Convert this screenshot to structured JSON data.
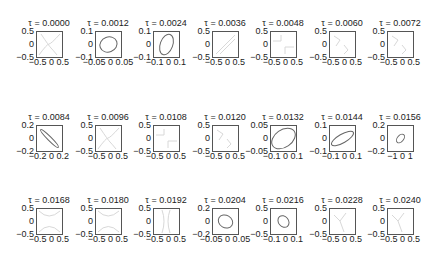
{
  "figure": {
    "background": "#ffffff",
    "axes_color": "#555555",
    "curve_color": "#666666",
    "faint_color": "#d8d8d8"
  },
  "chart_data": {
    "type": "line",
    "title": "",
    "layout": {
      "rows": 3,
      "cols": 7,
      "grid": false,
      "legend": "none"
    },
    "subplots": [
      {
        "title": "τ = 0.0000",
        "ylabels": [
          "0.5",
          "0",
          "−0.5"
        ],
        "xlabels": "−0.5 0 0.5",
        "xlim": [
          -0.5,
          0.5
        ],
        "ylim": [
          -0.5,
          0.5
        ],
        "curve": "faint-cross",
        "ellipse": null
      },
      {
        "title": "τ = 0.0012",
        "ylabels": [
          "0.1",
          "0",
          "−0.1"
        ],
        "xlabels": "−0.05 0 0.05",
        "xlim": [
          -0.05,
          0.05
        ],
        "ylim": [
          -0.1,
          0.1
        ],
        "curve": "ellipse",
        "ellipse": {
          "cx": 0,
          "cy": 0,
          "rx": 0.035,
          "ry": 0.06,
          "angle": -20
        }
      },
      {
        "title": "τ = 0.0024",
        "ylabels": [
          "0.1",
          "0",
          "−0.1"
        ],
        "xlabels": "−0.1 0 0.1",
        "xlim": [
          -0.1,
          0.1
        ],
        "ylim": [
          -0.1,
          0.1
        ],
        "curve": "ellipse",
        "ellipse": {
          "cx": 0,
          "cy": 0,
          "rx": 0.05,
          "ry": 0.085,
          "angle": 20
        }
      },
      {
        "title": "τ = 0.0036",
        "ylabels": [
          "0.5",
          "0",
          "−0.5"
        ],
        "xlabels": "−0.5 0 0.5",
        "xlim": [
          -0.5,
          0.5
        ],
        "ylim": [
          -0.5,
          0.5
        ],
        "curve": "faint-diagonal",
        "ellipse": null
      },
      {
        "title": "τ = 0.0048",
        "ylabels": [
          "0.5",
          "0",
          "−0.5"
        ],
        "xlabels": "−0.5 0 0.5",
        "xlim": [
          -0.5,
          0.5
        ],
        "ylim": [
          -0.5,
          0.5
        ],
        "curve": "faint-steps",
        "ellipse": null
      },
      {
        "title": "τ = 0.0060",
        "ylabels": [
          "0.5",
          "0",
          "−0.5"
        ],
        "xlabels": "−0.5 0 0.5",
        "xlim": [
          -0.5,
          0.5
        ],
        "ylim": [
          -0.5,
          0.5
        ],
        "curve": "faint-z",
        "ellipse": null
      },
      {
        "title": "τ = 0.0072",
        "ylabels": [
          "0.5",
          "0",
          "−0.5"
        ],
        "xlabels": "−0.5 0 0.5",
        "xlim": [
          -0.5,
          0.5
        ],
        "ylim": [
          -0.5,
          0.5
        ],
        "curve": "faint-z",
        "ellipse": null
      },
      {
        "title": "τ = 0.0084",
        "ylabels": [
          "0.2",
          "0",
          "−0.2"
        ],
        "xlabels": "−0.2 0 0.2",
        "xlim": [
          -0.2,
          0.2
        ],
        "ylim": [
          -0.2,
          0.2
        ],
        "curve": "ellipse",
        "ellipse": {
          "cx": 0,
          "cy": 0,
          "rx": 0.2,
          "ry": 0.03,
          "angle": 45
        }
      },
      {
        "title": "τ = 0.0096",
        "ylabels": [
          "0.5",
          "0",
          "−0.5"
        ],
        "xlabels": "−0.5 0 0.5",
        "xlim": [
          -0.5,
          0.5
        ],
        "ylim": [
          -0.5,
          0.5
        ],
        "curve": "faint-cross",
        "ellipse": null
      },
      {
        "title": "τ = 0.0108",
        "ylabels": [
          "0.5",
          "0",
          "−0.5"
        ],
        "xlabels": "−0.5 0 0.5",
        "xlim": [
          -0.5,
          0.5
        ],
        "ylim": [
          -0.5,
          0.5
        ],
        "curve": "faint-steps",
        "ellipse": null
      },
      {
        "title": "τ = 0.0120",
        "ylabels": [
          "0.5",
          "0",
          "−0.5"
        ],
        "xlabels": "−0.5 0 0.5",
        "xlim": [
          -0.5,
          0.5
        ],
        "ylim": [
          -0.5,
          0.5
        ],
        "curve": "faint-z",
        "ellipse": null
      },
      {
        "title": "τ = 0.0132",
        "ylabels": [
          "0.05",
          "0",
          "−0.05"
        ],
        "xlabels": "−0.1 0 0.1",
        "xlim": [
          -0.1,
          0.1
        ],
        "ylim": [
          -0.05,
          0.05
        ],
        "curve": "ellipse",
        "ellipse": {
          "cx": 0,
          "cy": 0,
          "rx": 0.11,
          "ry": 0.035,
          "angle": -35
        }
      },
      {
        "title": "τ = 0.0144",
        "ylabels": [
          "0.1",
          "0",
          "−0.1"
        ],
        "xlabels": "−0.1 0 0.1",
        "xlim": [
          -0.1,
          0.1
        ],
        "ylim": [
          -0.1,
          0.1
        ],
        "curve": "ellipse",
        "ellipse": {
          "cx": 0,
          "cy": 0,
          "rx": 0.1,
          "ry": 0.035,
          "angle": -30
        }
      },
      {
        "title": "τ = 0.0156",
        "ylabels": [
          "0.2",
          "0",
          "−0.2"
        ],
        "xlabels": "−1 0 1",
        "xlim": [
          -1.5,
          1.5
        ],
        "ylim": [
          -0.2,
          0.2
        ],
        "curve": "ellipse",
        "ellipse": {
          "cx": 0,
          "cy": 0,
          "rx": 0.6,
          "ry": 0.05,
          "angle": -50
        }
      },
      {
        "title": "τ = 0.0168",
        "ylabels": [
          "0.5",
          "0",
          "−0.5"
        ],
        "xlabels": "−0.5 0 0.5",
        "xlim": [
          -0.5,
          0.5
        ],
        "ylim": [
          -0.5,
          0.5
        ],
        "curve": "faint-x",
        "ellipse": null
      },
      {
        "title": "τ = 0.0180",
        "ylabels": [
          "0.5",
          "0",
          "−0.5"
        ],
        "xlabels": "−0.5 0 0.5",
        "xlim": [
          -0.5,
          0.5
        ],
        "ylim": [
          -0.5,
          0.5
        ],
        "curve": "faint-x",
        "ellipse": null
      },
      {
        "title": "τ = 0.0192",
        "ylabels": [
          "0.5",
          "0",
          "−0.5"
        ],
        "xlabels": "−0.5 0 0.5",
        "xlim": [
          -0.5,
          0.5
        ],
        "ylim": [
          -0.5,
          0.5
        ],
        "curve": "faint-hourglass",
        "ellipse": null
      },
      {
        "title": "τ = 0.0204",
        "ylabels": [
          "0.2",
          "0",
          "−0.2"
        ],
        "xlabels": "−0.05 0 0.05",
        "xlim": [
          -0.05,
          0.05
        ],
        "ylim": [
          -0.2,
          0.2
        ],
        "curve": "ellipse",
        "ellipse": {
          "cx": 0,
          "cy": 0,
          "rx": 0.03,
          "ry": 0.1,
          "angle": 30
        }
      },
      {
        "title": "τ = 0.0216",
        "ylabels": [
          "0.5",
          "0",
          "−0.5"
        ],
        "xlabels": "−0.1 0 0.1",
        "xlim": [
          -0.1,
          0.1
        ],
        "ylim": [
          -0.5,
          0.5
        ],
        "curve": "ellipse",
        "ellipse": {
          "cx": 0,
          "cy": 0,
          "rx": 0.05,
          "ry": 0.2,
          "angle": 50
        }
      },
      {
        "title": "τ = 0.0228",
        "ylabels": [
          "0.5",
          "0",
          "−0.5"
        ],
        "xlabels": "−0.5 0 0.5",
        "xlim": [
          -0.5,
          0.5
        ],
        "ylim": [
          -0.5,
          0.5
        ],
        "curve": "faint-y",
        "ellipse": null
      },
      {
        "title": "τ = 0.0240",
        "ylabels": [
          "0.5",
          "0",
          "−0.5"
        ],
        "xlabels": "−0.5 0 0.5",
        "xlim": [
          -0.5,
          0.5
        ],
        "ylim": [
          -0.5,
          0.5
        ],
        "curve": "faint-y",
        "ellipse": null
      }
    ]
  }
}
